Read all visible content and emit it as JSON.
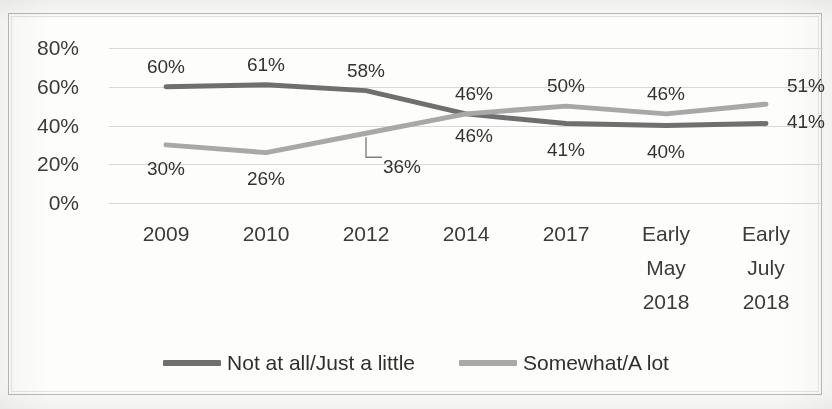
{
  "title": "",
  "colors": {
    "series_dark": "#6f6f6f",
    "series_light": "#a8a8a8",
    "gridline": "#d9d9d9",
    "frame": "#b9b9b9",
    "text": "#333333"
  },
  "chart_data": {
    "type": "line",
    "title": "",
    "xlabel": "",
    "ylabel": "",
    "ylim": [
      0,
      80
    ],
    "yticks": [
      0,
      20,
      40,
      60,
      80
    ],
    "ytick_labels": [
      "0%",
      "20%",
      "40%",
      "60%",
      "80%"
    ],
    "grid": true,
    "legend_position": "bottom",
    "categories": [
      "2009",
      "2010",
      "2012",
      "2014",
      "2017",
      "Early May 2018",
      "Early July 2018"
    ],
    "category_lines": [
      [
        "2009"
      ],
      [
        "2010"
      ],
      [
        "2012"
      ],
      [
        "2014"
      ],
      [
        "2017"
      ],
      [
        "Early",
        "May",
        "2018"
      ],
      [
        "Early",
        "July",
        "2018"
      ]
    ],
    "series": [
      {
        "name": "Not at all/Just a little",
        "color": "#6f6f6f",
        "values": [
          60,
          61,
          58,
          46,
          41,
          40,
          41
        ],
        "labels": [
          "60%",
          "61%",
          "58%",
          "46%",
          "41%",
          "40%",
          "41%"
        ]
      },
      {
        "name": "Somewhat/A lot",
        "color": "#a8a8a8",
        "values": [
          30,
          26,
          36,
          46,
          50,
          46,
          51
        ],
        "labels": [
          "30%",
          "26%",
          "36%",
          "46%",
          "50%",
          "46%",
          "51%"
        ]
      }
    ]
  },
  "legend": {
    "items": [
      {
        "label": "Not at all/Just a little",
        "color": "#6f6f6f"
      },
      {
        "label": "Somewhat/A lot",
        "color": "#a8a8a8"
      }
    ]
  }
}
